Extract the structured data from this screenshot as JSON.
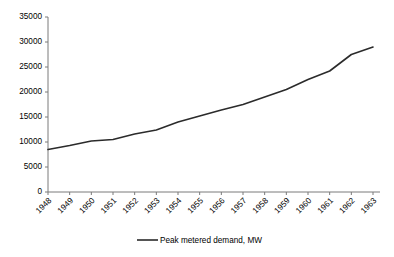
{
  "chart_data": {
    "type": "line",
    "title": "",
    "xlabel": "",
    "ylabel": "",
    "grid": false,
    "legend_position": "bottom-center",
    "categories": [
      "1948",
      "1949",
      "1950",
      "1951",
      "1952",
      "1953",
      "1954",
      "1955",
      "1956",
      "1957",
      "1958",
      "1959",
      "1960",
      "1961",
      "1962",
      "1963"
    ],
    "x": [
      1948,
      1949,
      1950,
      1951,
      1952,
      1953,
      1954,
      1955,
      1956,
      1957,
      1958,
      1959,
      1960,
      1961,
      1962,
      1963
    ],
    "ylim": [
      0,
      35000
    ],
    "yticks": [
      0,
      5000,
      10000,
      15000,
      20000,
      25000,
      30000,
      35000
    ],
    "ytick_labels": [
      "0",
      "5000",
      "10000",
      "15000",
      "20000",
      "25000",
      "30000",
      "35000"
    ],
    "xtick_labels": [
      "1948",
      "1949",
      "1950",
      "1951",
      "1952",
      "1953",
      "1954",
      "1955",
      "1956",
      "1957",
      "1958",
      "1959",
      "1960",
      "1961",
      "1962",
      "1963"
    ],
    "series": [
      {
        "name": "Peak metered demand, MW",
        "color": "#2b2b2b",
        "values": [
          8500,
          9300,
          10200,
          10500,
          11600,
          12400,
          14000,
          15200,
          16400,
          17500,
          19000,
          20500,
          22500,
          24200,
          27500,
          29000
        ]
      }
    ],
    "legend": [
      "Peak metered demand, MW"
    ]
  },
  "colors": {
    "series_line": "#2b2b2b",
    "axis": "#7a7a7a",
    "text": "#000000",
    "background": "#ffffff"
  }
}
